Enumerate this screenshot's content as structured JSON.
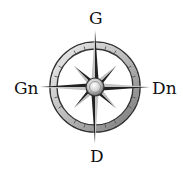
{
  "compass": {
    "labels": {
      "north": "G",
      "west": "Gn",
      "east": "Dn",
      "south": "D"
    },
    "colors": {
      "ring_light": "#d8d8d8",
      "ring_dark": "#3a3a3a",
      "point_dark": "#222222",
      "point_light": "#bdbdbd",
      "background": "#ffffff"
    }
  }
}
